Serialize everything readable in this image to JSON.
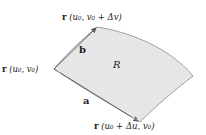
{
  "diagram": {
    "region_label": "R",
    "vectors": {
      "a": "a",
      "b": "b"
    },
    "points": {
      "origin": {
        "func": "r",
        "args": "(u₀, v₀)"
      },
      "top": {
        "func": "r",
        "args": "(u₀, v₀ + Δv)"
      },
      "bottom": {
        "func": "r",
        "args": "(u₀ + Δu, v₀)"
      }
    },
    "colors": {
      "surface_fill": "#e6e6e6",
      "surface_edge": "#8a8a8a",
      "arrow": "#555555"
    }
  }
}
